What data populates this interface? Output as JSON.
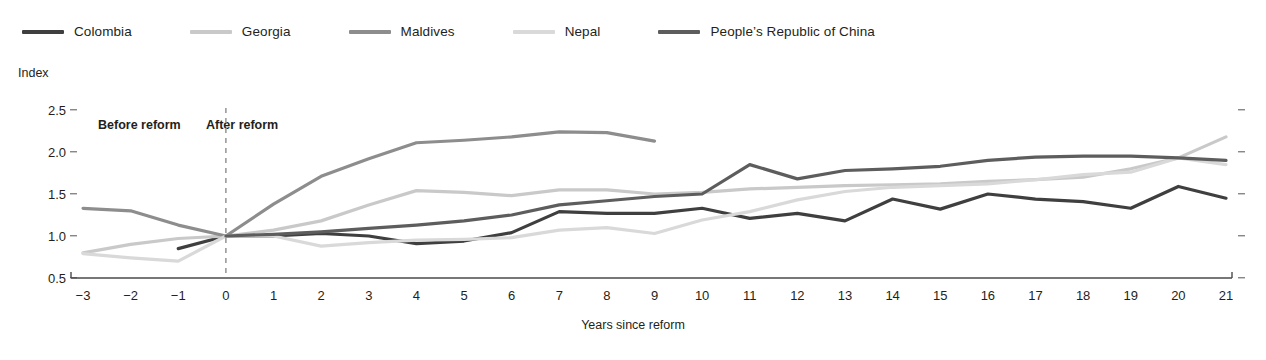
{
  "caption_sliver": "",
  "legend": {
    "items": [
      {
        "label": "Colombia",
        "color": "#3f3f3f"
      },
      {
        "label": "Georgia",
        "color": "#c9c9c9"
      },
      {
        "label": "Maldives",
        "color": "#8d8d8d"
      },
      {
        "label": "Nepal",
        "color": "#d9d9d9"
      },
      {
        "label": "People’s Republic of China",
        "color": "#5d5d5d"
      }
    ]
  },
  "annotations": {
    "before": "Before reform",
    "after": "After reform",
    "reform_line_x": 0
  },
  "chart_data": {
    "type": "line",
    "title": "",
    "xlabel": "Years since reform",
    "ylabel": "Index",
    "x": [
      -3,
      -2,
      -1,
      0,
      1,
      2,
      3,
      4,
      5,
      6,
      7,
      8,
      9,
      10,
      11,
      12,
      13,
      14,
      15,
      16,
      17,
      18,
      19,
      20,
      21
    ],
    "xlim": [
      -3,
      21
    ],
    "ylim": [
      0.5,
      2.5
    ],
    "yticks": [
      0.5,
      1.0,
      1.5,
      2.0,
      2.5
    ],
    "ytick_labels": [
      "0.5",
      "1.0",
      "1.5",
      "2.0",
      "2.5"
    ],
    "xtick_labels": [
      "−3",
      "−2",
      "−1",
      "0",
      "1",
      "2",
      "3",
      "4",
      "5",
      "6",
      "7",
      "8",
      "9",
      "10",
      "11",
      "12",
      "13",
      "14",
      "15",
      "16",
      "17",
      "18",
      "19",
      "20",
      "21"
    ],
    "grid": false,
    "legend_position": "top-left",
    "series": [
      {
        "name": "Colombia",
        "color": "#3f3f3f",
        "x": [
          -1,
          0,
          1,
          2,
          3,
          4,
          5,
          6,
          7,
          8,
          9,
          10,
          11,
          12,
          13,
          14,
          15,
          16,
          17,
          18,
          19,
          20,
          21
        ],
        "values": [
          0.85,
          1.0,
          1.0,
          1.03,
          1.0,
          0.91,
          0.94,
          1.04,
          1.29,
          1.27,
          1.27,
          1.33,
          1.21,
          1.27,
          1.18,
          1.44,
          1.32,
          1.5,
          1.44,
          1.41,
          1.33,
          1.59,
          1.45
        ]
      },
      {
        "name": "Georgia",
        "color": "#c9c9c9",
        "x": [
          -3,
          -2,
          -1,
          0,
          1,
          2,
          3,
          4,
          5,
          6,
          7,
          8,
          9,
          10,
          11,
          12,
          13,
          14,
          15,
          16,
          17,
          18,
          19,
          20,
          21
        ],
        "values": [
          0.8,
          0.9,
          0.97,
          1.0,
          1.07,
          1.18,
          1.37,
          1.54,
          1.52,
          1.48,
          1.55,
          1.55,
          1.5,
          1.52,
          1.56,
          1.58,
          1.6,
          1.61,
          1.62,
          1.65,
          1.67,
          1.7,
          1.8,
          1.93,
          2.18
        ]
      },
      {
        "name": "Maldives",
        "color": "#8d8d8d",
        "x": [
          -3,
          -2,
          -1,
          0,
          1,
          2,
          3,
          4,
          5,
          6,
          7,
          8,
          9
        ],
        "values": [
          1.33,
          1.3,
          1.13,
          1.0,
          1.38,
          1.71,
          1.92,
          2.11,
          2.14,
          2.18,
          2.24,
          2.23,
          2.13
        ]
      },
      {
        "name": "Nepal",
        "color": "#d9d9d9",
        "x": [
          -3,
          -2,
          -1,
          0,
          1,
          2,
          3,
          4,
          5,
          6,
          7,
          8,
          9,
          10,
          11,
          12,
          13,
          14,
          15,
          16,
          17,
          18,
          19,
          20,
          21
        ],
        "values": [
          0.79,
          0.74,
          0.7,
          1.0,
          1.0,
          0.88,
          0.92,
          0.95,
          0.96,
          0.98,
          1.07,
          1.1,
          1.03,
          1.19,
          1.29,
          1.43,
          1.53,
          1.58,
          1.6,
          1.62,
          1.67,
          1.73,
          1.76,
          1.93,
          1.85
        ]
      },
      {
        "name": "People’s Republic of China",
        "color": "#5d5d5d",
        "x": [
          0,
          1,
          2,
          3,
          4,
          5,
          6,
          7,
          8,
          9,
          10,
          11,
          12,
          13,
          14,
          15,
          16,
          17,
          18,
          19,
          20,
          21
        ],
        "values": [
          1.0,
          1.02,
          1.05,
          1.09,
          1.13,
          1.18,
          1.25,
          1.37,
          1.42,
          1.47,
          1.5,
          1.85,
          1.68,
          1.78,
          1.8,
          1.83,
          1.9,
          1.94,
          1.95,
          1.95,
          1.93,
          1.9
        ]
      }
    ]
  }
}
